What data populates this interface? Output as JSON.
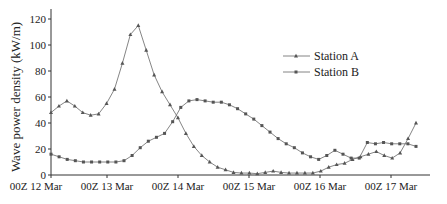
{
  "chart_data": {
    "type": "line",
    "title": "",
    "xlabel": "",
    "ylabel": "Wave power density (kW/m)",
    "ylim": [
      0,
      130
    ],
    "yticks": [
      0,
      20,
      40,
      60,
      80,
      100,
      120
    ],
    "xtick_labels": [
      "00Z 12 Mar",
      "00Z 13 Mar",
      "00Z 14 Mar",
      "00Z 15 Mar",
      "00Z 16 Mar",
      "00Z 17 Mar"
    ],
    "x_interval": "3-hourly",
    "grid": false,
    "legend_position": "upper right",
    "series": [
      {
        "name": "Station A",
        "marker": "triangle",
        "values": [
          48,
          53,
          57,
          53,
          48,
          46,
          47,
          55,
          66,
          86,
          108,
          115,
          96,
          77,
          64,
          54,
          44,
          32,
          22,
          15,
          10,
          6,
          4,
          2,
          1.5,
          1.5,
          1,
          2,
          3,
          2,
          1.5,
          1.5,
          1.5,
          1.5,
          3,
          6,
          8,
          9,
          12,
          14,
          16,
          18,
          15,
          13,
          17,
          28,
          40
        ]
      },
      {
        "name": "Station B",
        "marker": "square",
        "values": [
          16,
          14,
          12,
          11,
          10,
          10,
          10,
          10,
          10,
          11,
          15,
          21,
          26,
          29,
          32,
          41,
          52,
          57,
          58,
          57,
          56,
          56,
          54,
          51,
          47,
          43,
          38,
          33,
          28,
          24,
          21,
          17,
          14,
          12,
          15,
          19,
          16,
          13,
          13,
          25,
          24,
          25,
          24,
          24,
          24,
          22
        ]
      }
    ]
  }
}
